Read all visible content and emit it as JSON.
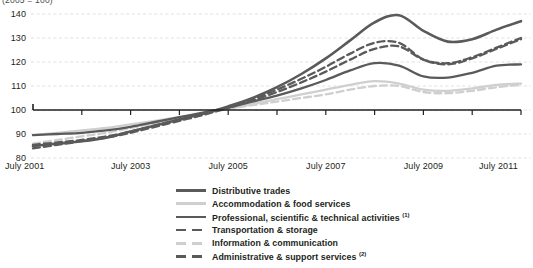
{
  "chart_data": {
    "type": "line",
    "title": "(2005 = 100)",
    "xlabel": "",
    "ylabel": "",
    "ylim": [
      80,
      140
    ],
    "yticks": [
      80,
      90,
      100,
      110,
      120,
      130,
      140
    ],
    "xlim": [
      "July 2001",
      "July 2011"
    ],
    "xticks": [
      "July 2001",
      "July 2003",
      "July 2005",
      "July 2007",
      "July 2009",
      "July 2011"
    ],
    "grid": true,
    "legend_position": "bottom",
    "x": [
      2001.5,
      2002.0,
      2002.5,
      2003.0,
      2003.5,
      2004.0,
      2004.5,
      2005.0,
      2005.5,
      2006.0,
      2006.5,
      2007.0,
      2007.5,
      2008.0,
      2008.5,
      2009.0,
      2009.5,
      2010.0,
      2010.5,
      2011.0,
      2011.5
    ],
    "series": [
      {
        "name": "Distributive trades",
        "color": "#5a5a5a",
        "style": "solid",
        "width": 2.3,
        "values": [
          89.5,
          90.0,
          90.5,
          91.5,
          93.0,
          95.0,
          97.0,
          99.0,
          101.0,
          103.5,
          106.0,
          109.0,
          112.5,
          116.5,
          119.5,
          118.5,
          114.0,
          113.5,
          115.5,
          118.5,
          119.0
        ]
      },
      {
        "name": "Accommodation & food services",
        "color": "#cfcfcf",
        "style": "solid",
        "width": 2.3,
        "values": [
          89.5,
          90.5,
          91.5,
          92.5,
          94.0,
          95.5,
          97.0,
          98.5,
          100.5,
          102.5,
          104.5,
          106.5,
          108.5,
          110.5,
          112.0,
          111.0,
          108.5,
          108.0,
          109.0,
          110.5,
          111.0
        ]
      },
      {
        "name": "Professional, scientific & technical activities",
        "footnote": "1",
        "color": "#5a5a5a",
        "style": "solid",
        "width": 2.6,
        "values": [
          85.0,
          86.0,
          87.0,
          88.5,
          91.0,
          93.5,
          96.0,
          98.5,
          101.5,
          105.0,
          109.5,
          115.0,
          121.5,
          129.0,
          136.5,
          139.5,
          133.0,
          128.5,
          129.5,
          133.5,
          137.0
        ]
      },
      {
        "name": "Transportation & storage",
        "color": "#5a5a5a",
        "style": "dashed",
        "width": 2.3,
        "values": [
          85.5,
          86.5,
          87.5,
          89.0,
          91.0,
          93.5,
          96.0,
          98.5,
          101.0,
          104.0,
          107.5,
          111.5,
          116.0,
          121.0,
          125.5,
          126.5,
          121.0,
          119.5,
          122.0,
          126.0,
          130.0
        ]
      },
      {
        "name": "Information & communication",
        "color": "#cfcfcf",
        "style": "dashed",
        "width": 2.3,
        "values": [
          86.0,
          87.5,
          89.0,
          90.5,
          92.5,
          94.5,
          96.5,
          98.5,
          100.5,
          102.0,
          103.5,
          105.0,
          106.5,
          108.5,
          110.0,
          110.0,
          107.5,
          107.0,
          108.0,
          109.5,
          110.5
        ]
      },
      {
        "name": "Administrative & support services",
        "footnote": "2",
        "color": "#5a5a5a",
        "style": "dashed",
        "width": 2.3,
        "values": [
          84.0,
          85.5,
          87.0,
          88.5,
          90.5,
          93.0,
          95.5,
          98.0,
          101.0,
          104.5,
          108.5,
          113.0,
          118.0,
          123.5,
          128.0,
          128.0,
          121.0,
          119.0,
          121.5,
          125.5,
          129.5
        ]
      }
    ]
  },
  "legend": {
    "items": [
      {
        "label": "Distributive trades",
        "footnote": "",
        "swatch": "solid-dark"
      },
      {
        "label": "Accommodation & food services",
        "footnote": "",
        "swatch": "solid-light"
      },
      {
        "label": "Professional, scientific & technical activities",
        "footnote": "1",
        "swatch": "solid-dark"
      },
      {
        "label": "Transportation & storage",
        "footnote": "",
        "swatch": "dash-dark"
      },
      {
        "label": "Information & communication",
        "footnote": "",
        "swatch": "dash-light"
      },
      {
        "label": "Administrative & support services",
        "footnote": "2",
        "swatch": "dash-dark"
      }
    ]
  },
  "colors": {
    "dark_line": "#5a5a5a",
    "light_line": "#cfcfcf",
    "grid": "#d9d9d9",
    "axis": "#231f20",
    "text": "#231f20"
  }
}
